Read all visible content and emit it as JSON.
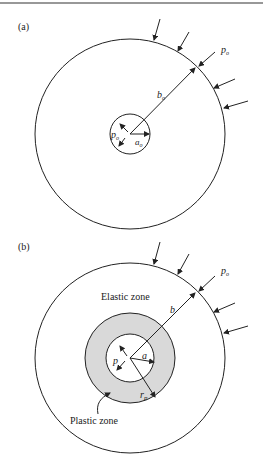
{
  "figure": {
    "panels": [
      {
        "id": "a",
        "label": "(a)",
        "outer_pressure": "p",
        "outer_pressure_sub": "o",
        "outer_radius": "b",
        "outer_radius_sub": "o",
        "inner_pressure": "p",
        "inner_pressure_sub": "o",
        "inner_radius": "a",
        "inner_radius_sub": "o"
      },
      {
        "id": "b",
        "label": "(b)",
        "outer_pressure": "p",
        "outer_pressure_sub": "o",
        "outer_radius": "b",
        "inner_pressure": "p",
        "inner_radius": "a",
        "plastic_radius": "r",
        "plastic_radius_sub": "p",
        "elastic_zone_label": "Elastic zone",
        "plastic_zone_label": "Plastic zone"
      }
    ],
    "colors": {
      "line": "#222222",
      "plastic_fill": "#d9d9d9",
      "background": "#ffffff"
    }
  }
}
